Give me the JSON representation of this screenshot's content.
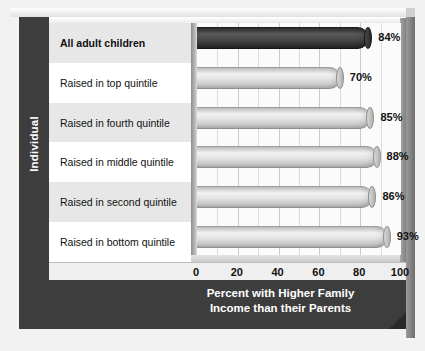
{
  "chart_data": {
    "type": "bar",
    "orientation": "horizontal",
    "title": "",
    "categories": [
      "All adult children",
      "Raised in top quintile",
      "Raised in fourth quintile",
      "Raised in middle quintile",
      "Raised in second quintile",
      "Raised in bottom quintile"
    ],
    "values": [
      84,
      70,
      85,
      88,
      86,
      93
    ],
    "value_labels": [
      "84%",
      "70%",
      "85%",
      "88%",
      "86%",
      "93%"
    ],
    "highlighted_index": 0,
    "xlabel": "Percent with Higher Family Income than their Parents",
    "ylabel": "Individual",
    "xlim": [
      0,
      100
    ],
    "xticks": [
      0,
      20,
      40,
      60,
      80,
      100
    ],
    "xtick_labels": [
      "0",
      "20",
      "40",
      "60",
      "80",
      "100"
    ],
    "grid": true,
    "grid_minor_step": 10,
    "legend": null,
    "colors": {
      "highlight_bar": "#3c3c3c",
      "bar": "#d8d8d8",
      "frame": "#3d3d3d",
      "row_alt": "#e7e7e7",
      "row_plain": "#ffffff",
      "plot_background": "#fbfbfb",
      "text": "#111111",
      "frame_text": "#ffffff"
    }
  },
  "axis": {
    "vertical_title": "Individual",
    "horizontal_title_line1": "Percent with Higher Family",
    "horizontal_title_line2": "Income than their Parents"
  }
}
